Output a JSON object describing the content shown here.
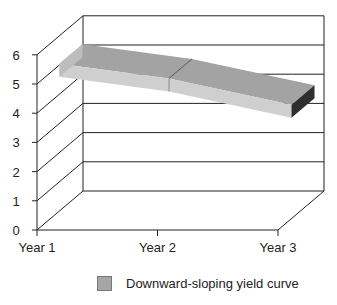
{
  "chart_data": {
    "type": "area",
    "style": "3d-ribbon",
    "title": "",
    "xlabel": "",
    "ylabel": "",
    "categories": [
      "Year 1",
      "Year 2",
      "Year 3"
    ],
    "series": [
      {
        "name": "Downward-sloping yield curve",
        "values": [
          5.7,
          5.2,
          4.3
        ],
        "color": "#a6a6a6"
      }
    ],
    "yticks": [
      "0",
      "1",
      "2",
      "3",
      "4",
      "5",
      "6"
    ],
    "ylim": [
      0,
      7
    ],
    "grid": true,
    "legend_position": "bottom"
  },
  "legend": {
    "label": "Downward-sloping yield curve"
  }
}
